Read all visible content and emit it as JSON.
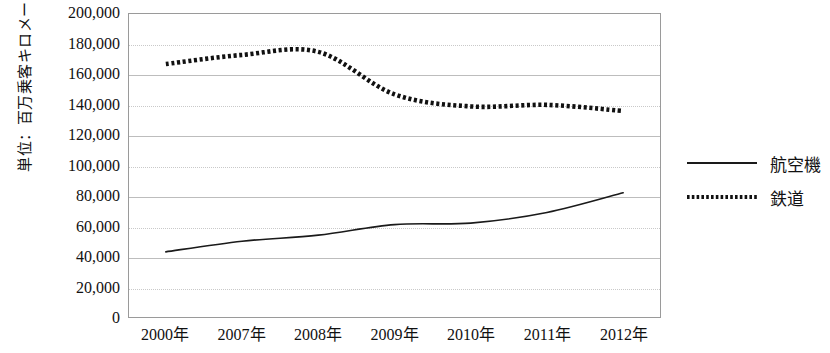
{
  "chart_data": {
    "type": "line",
    "title": "",
    "xlabel": "",
    "ylabel": "単位：百万乗客キロメートル",
    "categories": [
      "2000年",
      "2007年",
      "2008年",
      "2009年",
      "2010年",
      "2011年",
      "2012年"
    ],
    "series": [
      {
        "name": "航空機",
        "style": "solid",
        "color": "#1a1a1a",
        "values": [
          43000,
          50000,
          54000,
          61000,
          62000,
          69000,
          82000
        ]
      },
      {
        "name": "鉄道",
        "style": "dotted",
        "color": "#111111",
        "values": [
          167000,
          173000,
          175000,
          147000,
          139000,
          140000,
          136000
        ]
      }
    ],
    "ylim": [
      0,
      200000
    ],
    "yticks": [
      "200,000",
      "180,000",
      "160,000",
      "140,000",
      "120,000",
      "100,000",
      "80,000",
      "60,000",
      "40,000",
      "20,000",
      "0"
    ],
    "ytick_values": [
      200000,
      180000,
      160000,
      140000,
      120000,
      100000,
      80000,
      60000,
      40000,
      20000,
      0
    ],
    "grid": true,
    "legend_position": "right"
  },
  "legend": {
    "items": [
      {
        "label": "航空機",
        "key": "solid-line-key"
      },
      {
        "label": "鉄道",
        "key": "dotted-line-key"
      }
    ]
  }
}
